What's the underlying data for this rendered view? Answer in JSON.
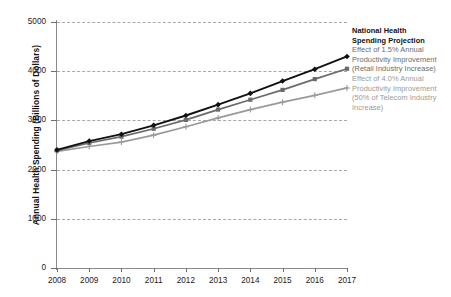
{
  "chart_data": {
    "type": "line",
    "title": "",
    "xlabel": "",
    "ylabel": "Annual Health Spending (Billions of Dollars)",
    "x": [
      2008,
      2009,
      2010,
      2011,
      2012,
      2013,
      2014,
      2015,
      2016,
      2017
    ],
    "xticklabels": [
      "2008",
      "2009",
      "2010",
      "2011",
      "2012",
      "2013",
      "2014",
      "2015",
      "2016",
      "2017"
    ],
    "yticks": [
      0,
      1000,
      2000,
      3000,
      4000,
      5000
    ],
    "yticklabels": [
      "0",
      "1000",
      "2000",
      "3000",
      "4000",
      "5000"
    ],
    "ylim": [
      0,
      5000
    ],
    "xlim": [
      2008,
      2017
    ],
    "grid": true,
    "grid_axis": "y",
    "grid_style": "dashed",
    "legend_position": "right-inline",
    "series": [
      {
        "name": "National Health Spending Projection",
        "color": "#111111",
        "marker": "diamond",
        "values": [
          2400,
          2580,
          2720,
          2900,
          3100,
          3320,
          3550,
          3800,
          4040,
          4300
        ]
      },
      {
        "name": "Effect of 1.5% Annual Productivity Improvement (Retail Industry Increase)",
        "color": "#6b6b6b",
        "marker": "square",
        "values": [
          2390,
          2540,
          2670,
          2830,
          3010,
          3220,
          3420,
          3620,
          3840,
          4050
        ]
      },
      {
        "name": "Effect of 4.0% Annual Productivity Improvement (50% of Telecom Industry Increase)",
        "color": "#9a9a9a",
        "marker": "plus",
        "values": [
          2370,
          2470,
          2560,
          2700,
          2870,
          3050,
          3220,
          3370,
          3510,
          3660
        ]
      }
    ]
  },
  "legend": {
    "entries": [
      {
        "lines": [
          "National Health",
          "Spending Projection"
        ],
        "color": "#111111",
        "marker": "diamond"
      },
      {
        "lines": [
          "Effect of 1.5% Annual",
          "Productivity Improvement",
          "(Retail Industry Increase)"
        ],
        "color": "#6b6b6b",
        "marker": "square"
      },
      {
        "lines": [
          "Effect of 4.0% Annual",
          "Productivity Improvement",
          "(50% of Telecom Industry",
          "Increase)"
        ],
        "color": "#9a9a9a",
        "marker": "plus"
      }
    ]
  },
  "colors": {
    "axis": "#8a8a8a",
    "grid": "#9a9a9a",
    "text": "#1a1a1a",
    "background": "#ffffff"
  }
}
